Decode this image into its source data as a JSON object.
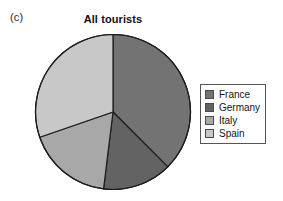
{
  "panel": {
    "label": "(c)"
  },
  "chart_data": {
    "type": "pie",
    "title": "All tourists",
    "xlabel": "",
    "ylabel": "",
    "categories": [
      "France",
      "Germany",
      "Italy",
      "Spain"
    ],
    "values": [
      37.5,
      14.4,
      17.8,
      30.3
    ],
    "angles_deg": [
      135,
      52,
      64,
      109
    ],
    "start_angle_deg": 0,
    "direction": "clockwise",
    "colors": [
      "#737373",
      "#636363",
      "#a8a8a8",
      "#c8c8c8"
    ],
    "legend_position": "right",
    "grid": false,
    "labels_on_slices": false,
    "series": [
      {
        "name": "All tourists",
        "values": [
          37.5,
          14.4,
          17.8,
          30.3
        ]
      }
    ]
  },
  "legend": {
    "items": [
      {
        "label": "France",
        "color": "#737373"
      },
      {
        "label": "Germany",
        "color": "#636363"
      },
      {
        "label": "Italy",
        "color": "#a8a8a8"
      },
      {
        "label": "Spain",
        "color": "#c8c8c8"
      }
    ]
  },
  "style": {
    "slice_outline": "#1c1c1c",
    "legend_border": "#555555",
    "background": "#ffffff"
  }
}
